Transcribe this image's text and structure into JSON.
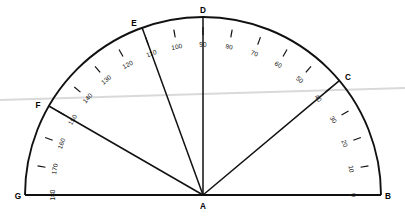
{
  "figure": {
    "type": "protractor-diagram",
    "center_label": "A",
    "background_color": "#ffffff",
    "line_color": "#111111"
  },
  "geometry": {
    "center_x": 203,
    "center_y": 195,
    "radius": 178,
    "tick_inner_offset": 10,
    "tick_length": 8,
    "label_radius": 150,
    "arc_start_deg": 0,
    "arc_end_deg": 180
  },
  "vertices": [
    {
      "name": "A",
      "label": "A",
      "angle_deg": null,
      "x": 203,
      "y": 207,
      "role": "center"
    },
    {
      "name": "B",
      "label": "B",
      "angle_deg": 0,
      "x": 388,
      "y": 197,
      "role": "ray-endpoint"
    },
    {
      "name": "C",
      "label": "C",
      "angle_deg": 40,
      "x": 348,
      "y": 78,
      "role": "ray-endpoint"
    },
    {
      "name": "D",
      "label": "D",
      "angle_deg": 90,
      "x": 203,
      "y": 11,
      "role": "ray-endpoint"
    },
    {
      "name": "E",
      "label": "E",
      "angle_deg": 110,
      "x": 134,
      "y": 24,
      "role": "ray-endpoint"
    },
    {
      "name": "F",
      "label": "F",
      "angle_deg": 150,
      "x": 38,
      "y": 106,
      "role": "ray-endpoint"
    },
    {
      "name": "G",
      "label": "G",
      "angle_deg": 180,
      "x": 18,
      "y": 197,
      "role": "ray-endpoint"
    }
  ],
  "rays": [
    {
      "name": "ray-AB",
      "from": "A",
      "to": "B",
      "angle_deg": 0
    },
    {
      "name": "ray-AC",
      "from": "A",
      "to": "C",
      "angle_deg": 40
    },
    {
      "name": "ray-AD",
      "from": "A",
      "to": "D",
      "angle_deg": 90
    },
    {
      "name": "ray-AE",
      "from": "A",
      "to": "E",
      "angle_deg": 110
    },
    {
      "name": "ray-AF",
      "from": "A",
      "to": "F",
      "angle_deg": 150
    },
    {
      "name": "ray-AG",
      "from": "A",
      "to": "G",
      "angle_deg": 180
    }
  ],
  "scale": {
    "step_deg": 10,
    "labels": [
      {
        "value": "0",
        "angle_deg": 0
      },
      {
        "value": "10",
        "angle_deg": 10
      },
      {
        "value": "20",
        "angle_deg": 20
      },
      {
        "value": "30",
        "angle_deg": 30
      },
      {
        "value": "40",
        "angle_deg": 40
      },
      {
        "value": "50",
        "angle_deg": 50
      },
      {
        "value": "60",
        "angle_deg": 60
      },
      {
        "value": "70",
        "angle_deg": 70
      },
      {
        "value": "80",
        "angle_deg": 80
      },
      {
        "value": "90",
        "angle_deg": 90
      },
      {
        "value": "100",
        "angle_deg": 100
      },
      {
        "value": "110",
        "angle_deg": 110
      },
      {
        "value": "120",
        "angle_deg": 120
      },
      {
        "value": "130",
        "angle_deg": 130
      },
      {
        "value": "140",
        "angle_deg": 140
      },
      {
        "value": "150",
        "angle_deg": 150
      },
      {
        "value": "160",
        "angle_deg": 160
      },
      {
        "value": "170",
        "angle_deg": 170
      },
      {
        "value": "180",
        "angle_deg": 180
      }
    ],
    "ticks_deg": [
      10,
      20,
      30,
      40,
      50,
      60,
      70,
      80,
      90,
      100,
      110,
      120,
      130,
      140,
      150,
      160,
      170
    ]
  },
  "artifact": {
    "present": true,
    "color": "#d9d9d9",
    "x1": 0,
    "y1": 100,
    "x2": 405,
    "y2": 88
  }
}
